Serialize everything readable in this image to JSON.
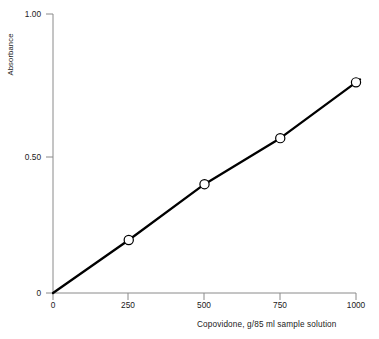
{
  "chart_data": {
    "type": "line",
    "title": "",
    "subtitle": "",
    "xlabel": "Copovidone, g/85 ml sample solution",
    "ylabel": "Absorbance",
    "xlim": [
      0,
      1000
    ],
    "ylim": [
      0,
      1.0
    ],
    "grid": false,
    "legend": false,
    "x_ticks": [
      "0",
      "250",
      "500",
      "750",
      "1000"
    ],
    "x_tick_values": [
      0,
      250,
      500,
      750,
      1000
    ],
    "y_ticks": [
      "0",
      "0.50",
      "1.00"
    ],
    "y_tick_values": [
      0,
      0.5,
      1.0
    ],
    "series": [
      {
        "name": "Calibration curve",
        "x": [
          0,
          250,
          500,
          750,
          1000
        ],
        "values": [
          0,
          0.19,
          0.39,
          0.555,
          0.755
        ],
        "marker": "open-circle",
        "line_color": "#000000",
        "marker_face_color": "#ffffff",
        "marker_edge_color": "#000000"
      }
    ],
    "colors": {
      "line": "#000000",
      "axis": "#8a8a8a",
      "text": "#1a1a1a",
      "background": "#ffffff"
    }
  },
  "axes": {
    "y_title": "Absorbance",
    "x_title": "Copovidone, g/85 ml sample solution",
    "y_tick_labels": [
      "1.00",
      "0.50",
      "0"
    ],
    "x_tick_labels": [
      "0",
      "250",
      "500",
      "750",
      "1000"
    ]
  }
}
